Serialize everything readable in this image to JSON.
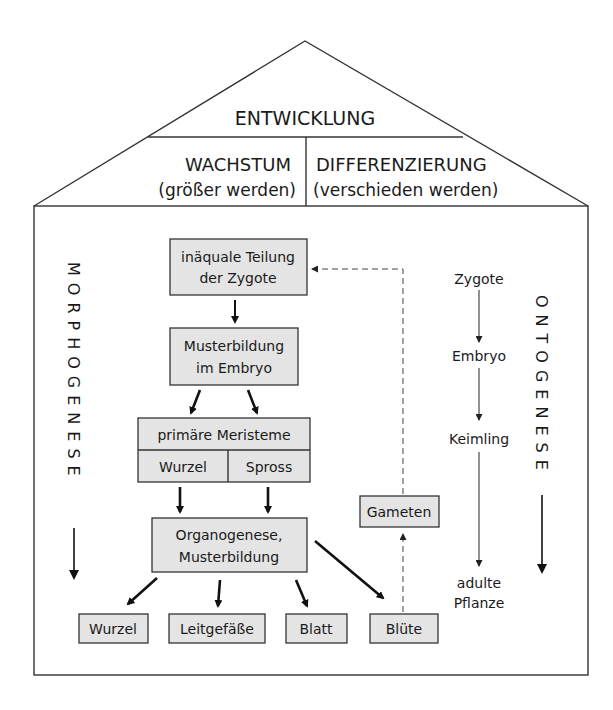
{
  "roof": {
    "title": "ENTWICKLUNG",
    "left": {
      "title": "WACHSTUM",
      "subtitle": "(größer werden)"
    },
    "right": {
      "title": "DIFFERENZIERUNG",
      "subtitle": "(verschieden werden)"
    }
  },
  "side_labels": {
    "left": "MORPHOGENESE",
    "right": "ONTOGENESE"
  },
  "flow": {
    "zygote_division": {
      "line1": "inäquale Teilung",
      "line2": "der Zygote"
    },
    "embryo_pattern": {
      "line1": "Musterbildung",
      "line2": "im Embryo"
    },
    "meristems": {
      "title": "primäre Meristeme",
      "left": "Wurzel",
      "right": "Spross"
    },
    "organogenesis": {
      "line1": "Organogenese,",
      "line2": "Musterbildung"
    },
    "organs": [
      "Wurzel",
      "Leitgefäße",
      "Blatt",
      "Blüte"
    ],
    "gametes": "Gameten"
  },
  "ontogeny_stages": [
    "Zygote",
    "Embryo",
    "Keimling",
    "adulte",
    "Pflanze"
  ],
  "colors": {
    "box_fill": "#e4e4e4",
    "stroke": "#333333"
  }
}
